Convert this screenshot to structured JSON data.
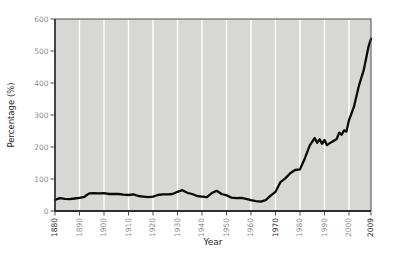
{
  "chart_data": {
    "type": "line",
    "title": "",
    "xlabel": "Year",
    "ylabel": "Percentage (%)",
    "xlim": [
      1880,
      2009
    ],
    "ylim": [
      0,
      600
    ],
    "x_ticks": [
      1880,
      1890,
      1900,
      1910,
      1920,
      1930,
      1940,
      1950,
      1960,
      1970,
      1980,
      1990,
      2000,
      2009
    ],
    "x_ticks_emphasized": [
      1880,
      1970,
      2009
    ],
    "y_ticks": [
      0,
      100,
      200,
      300,
      400,
      500,
      600
    ],
    "grid": "vertical-only",
    "legend": "none",
    "series": [
      {
        "name": "percentage",
        "x": [
          1880,
          1882,
          1884,
          1886,
          1888,
          1890,
          1892,
          1893,
          1894,
          1896,
          1898,
          1900,
          1902,
          1904,
          1906,
          1908,
          1910,
          1912,
          1914,
          1916,
          1918,
          1920,
          1922,
          1924,
          1926,
          1928,
          1930,
          1932,
          1934,
          1936,
          1938,
          1940,
          1942,
          1944,
          1946,
          1948,
          1950,
          1952,
          1954,
          1956,
          1958,
          1960,
          1962,
          1964,
          1966,
          1968,
          1970,
          1972,
          1974,
          1976,
          1978,
          1980,
          1982,
          1984,
          1986,
          1987,
          1988,
          1989,
          1990,
          1991,
          1993,
          1995,
          1996,
          1997,
          1998,
          1999,
          2000,
          2002,
          2004,
          2006,
          2008,
          2009
        ],
        "y": [
          35,
          40,
          38,
          37,
          39,
          41,
          44,
          50,
          55,
          56,
          55,
          56,
          53,
          53,
          53,
          51,
          50,
          52,
          47,
          45,
          43,
          45,
          50,
          52,
          52,
          53,
          60,
          65,
          57,
          53,
          47,
          45,
          43,
          56,
          63,
          53,
          49,
          42,
          40,
          41,
          38,
          34,
          31,
          29,
          34,
          48,
          60,
          90,
          102,
          118,
          128,
          130,
          165,
          205,
          228,
          213,
          224,
          210,
          222,
          206,
          216,
          225,
          245,
          238,
          252,
          248,
          284,
          325,
          390,
          440,
          515,
          538
        ]
      }
    ],
    "colors": {
      "plot_bg": "#d7d7d5",
      "gridline": "#ffffff",
      "line": "#0a0a0a",
      "frame": "#4d4d4d",
      "axis": "#2e2e2e",
      "tick": "#4d4d4d",
      "tick_label": "#8e8e8e",
      "tick_label_emphasis": "#1f1f1f",
      "axis_title": "#1f1f1f"
    }
  }
}
